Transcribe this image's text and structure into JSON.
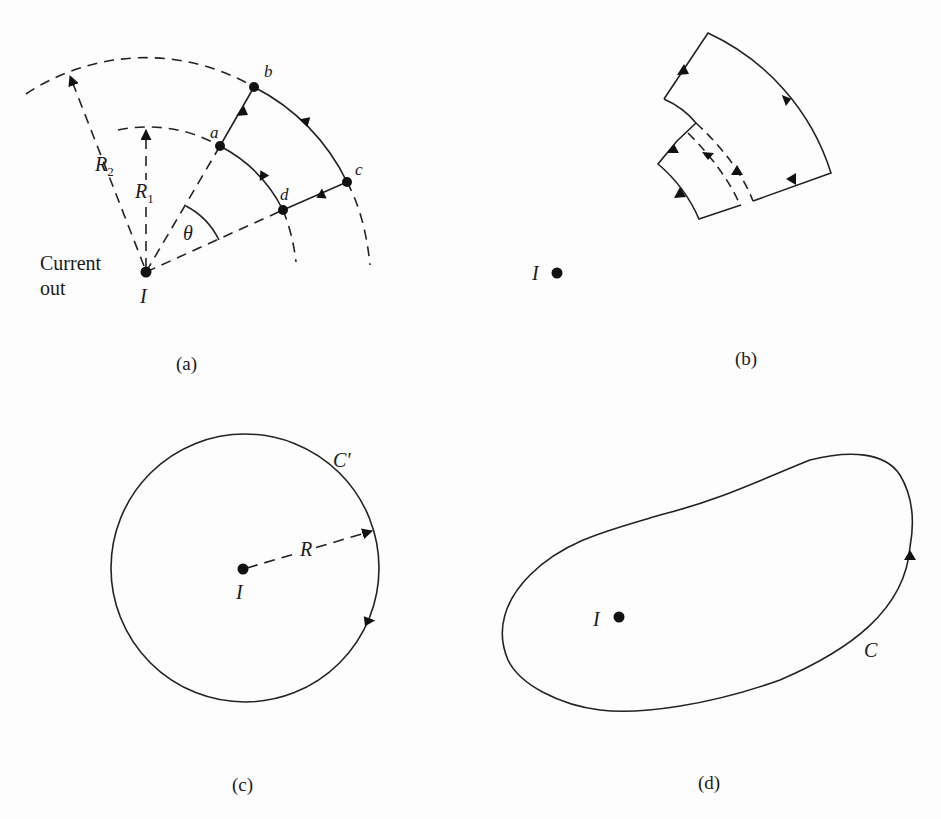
{
  "figure": {
    "panels": [
      {
        "id": "a",
        "caption": "(a)",
        "labels": {
          "current_line1": "Current",
          "current_line2": "out",
          "I": "I",
          "R1": "R",
          "R1_sub": "1",
          "R2": "R",
          "R2_sub": "2",
          "theta": "θ",
          "a": "a",
          "b": "b",
          "c": "c",
          "d": "d"
        }
      },
      {
        "id": "b",
        "caption": "(b)",
        "labels": {
          "I": "I"
        }
      },
      {
        "id": "c",
        "caption": "(c)",
        "labels": {
          "I": "I",
          "R": "R",
          "curve": "C′"
        }
      },
      {
        "id": "d",
        "caption": "(d)",
        "labels": {
          "I": "I",
          "curve": "C"
        }
      }
    ]
  }
}
